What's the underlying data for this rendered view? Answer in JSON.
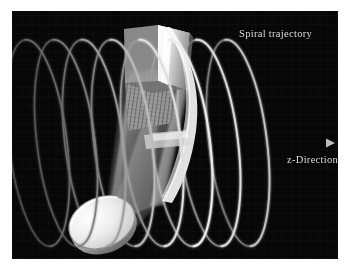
{
  "figure": {
    "background_color": "#ffffff",
    "panel_color": "#070707",
    "panel": {
      "x": 12,
      "y": 11,
      "width": 326,
      "height": 248
    }
  },
  "annotations": {
    "spiral_label": "Spiral trajectory",
    "axis_label": "z-Direction"
  },
  "colors": {
    "panel_background": "#070707",
    "helix_bright": "#e8e8e8",
    "helix_dim": "#6e6e6e",
    "axis_arrow": "#9a9a9a",
    "label_text": "#dcdcdc",
    "block_light": "#ffffff",
    "block_mid": "#b8b8b8",
    "block_dark": "#7a7a7a",
    "disc_light": "#f2f2f2",
    "disc_rim": "#8c8c8c",
    "cone_fill": "#b4b4b4"
  },
  "geometry": {
    "axis": {
      "name": "z-axis",
      "start": {
        "x": 60,
        "y": 132
      },
      "end": {
        "x": 318,
        "y": 132
      },
      "arrowhead": true
    },
    "helix": {
      "type": "spiral-trajectory",
      "turn_count": 8,
      "ellipse_rx": 29,
      "ellipse_ry": 104,
      "center_y": 132,
      "pitch": 29,
      "first_center_x": 26,
      "tilt_degrees": -7,
      "turn_centers_x": [
        26,
        54,
        82,
        111,
        140,
        169,
        197,
        226
      ],
      "turn_brightness": [
        0.35,
        0.42,
        0.55,
        0.7,
        0.85,
        1.0,
        0.9,
        0.72
      ]
    },
    "block": {
      "name": "detector-block",
      "x": 112,
      "y": 14,
      "width": 72,
      "height": 62
    },
    "cone": {
      "name": "beam-cone",
      "apex": {
        "x": 96,
        "y": 214
      },
      "base_center": {
        "x": 150,
        "y": 70
      }
    },
    "disc": {
      "name": "source-disc",
      "center": {
        "x": 92,
        "y": 217
      },
      "rx": 34,
      "ry": 25,
      "rotation_degrees": -22
    }
  }
}
